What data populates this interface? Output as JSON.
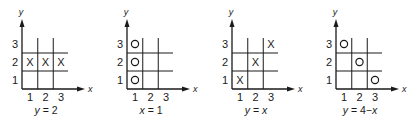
{
  "figure": {
    "axes": {
      "x_label": "x",
      "y_label": "y"
    },
    "tick_labels": {
      "x": [
        "1",
        "2",
        "3"
      ],
      "y": [
        "1",
        "2",
        "3"
      ]
    },
    "panels": [
      {
        "id": "panel-y-eq-2",
        "origin_x": 22,
        "caption": "y = 2",
        "mark": "X",
        "points": [
          [
            1,
            2
          ],
          [
            2,
            2
          ],
          [
            3,
            2
          ]
        ],
        "grid_lines": {
          "vertical_at": [
            1.5,
            2.5
          ],
          "horizontal_at": [
            1.5,
            2.5
          ]
        }
      },
      {
        "id": "panel-x-eq-1",
        "origin_x": 127,
        "caption": "x = 1",
        "mark": "O",
        "points": [
          [
            1,
            1
          ],
          [
            1,
            2
          ],
          [
            1,
            3
          ]
        ],
        "grid_lines": {
          "vertical_at": [
            1.5,
            2.5
          ],
          "horizontal_at": [
            1.5,
            2.5
          ]
        }
      },
      {
        "id": "panel-y-eq-x",
        "origin_x": 232,
        "caption": "y = x",
        "mark": "X",
        "points": [
          [
            1,
            1
          ],
          [
            2,
            2
          ],
          [
            3,
            3
          ]
        ],
        "grid_lines": {
          "vertical_at": [
            1.5,
            2.5
          ],
          "horizontal_at": [
            1.5,
            2.5
          ]
        }
      },
      {
        "id": "panel-y-eq-4-minus-x",
        "origin_x": 336,
        "caption": "y = 4−x",
        "mark": "O",
        "points": [
          [
            1,
            3
          ],
          [
            2,
            2
          ],
          [
            3,
            1
          ]
        ],
        "grid_lines": {
          "vertical_at": [
            1.5,
            2.5
          ],
          "horizontal_at": [
            1.5,
            2.5
          ]
        }
      }
    ]
  },
  "chart_data": [
    {
      "type": "scatter",
      "title": "y = 2",
      "xlabel": "x",
      "ylabel": "y",
      "xlim": [
        1,
        3
      ],
      "ylim": [
        1,
        3
      ],
      "marker": "X",
      "x": [
        1,
        2,
        3
      ],
      "y": [
        2,
        2,
        2
      ]
    },
    {
      "type": "scatter",
      "title": "x = 1",
      "xlabel": "x",
      "ylabel": "y",
      "xlim": [
        1,
        3
      ],
      "ylim": [
        1,
        3
      ],
      "marker": "O",
      "x": [
        1,
        1,
        1
      ],
      "y": [
        1,
        2,
        3
      ]
    },
    {
      "type": "scatter",
      "title": "y = x",
      "xlabel": "x",
      "ylabel": "y",
      "xlim": [
        1,
        3
      ],
      "ylim": [
        1,
        3
      ],
      "marker": "X",
      "x": [
        1,
        2,
        3
      ],
      "y": [
        1,
        2,
        3
      ]
    },
    {
      "type": "scatter",
      "title": "y = 4−x",
      "xlabel": "x",
      "ylabel": "y",
      "xlim": [
        1,
        3
      ],
      "ylim": [
        1,
        3
      ],
      "marker": "O",
      "x": [
        1,
        2,
        3
      ],
      "y": [
        3,
        2,
        1
      ]
    }
  ]
}
